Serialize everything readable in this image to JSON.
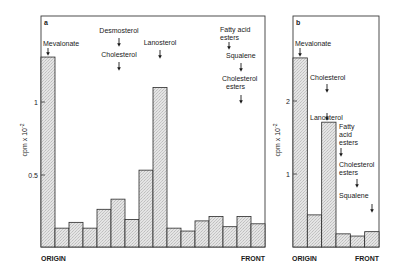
{
  "chart_data": [
    {
      "panel": "a",
      "type": "bar",
      "title": "",
      "xlabel": "",
      "ylabel": "cpm x 10-2",
      "x_start_label": "ORIGIN",
      "x_end_label": "FRONT",
      "ylim": [
        0,
        1.4
      ],
      "yticks": [
        0.5,
        1
      ],
      "ytick_labels": [
        "0.5",
        "1"
      ],
      "grid": false,
      "categories": [
        "1",
        "2",
        "3",
        "4",
        "5",
        "6",
        "7",
        "8",
        "9",
        "10",
        "11",
        "12",
        "13",
        "14",
        "15",
        "16"
      ],
      "values": [
        1.31,
        0.13,
        0.17,
        0.13,
        0.26,
        0.33,
        0.19,
        0.53,
        1.1,
        0.13,
        0.11,
        0.18,
        0.21,
        0.14,
        0.21,
        0.16
      ],
      "annotations": [
        {
          "lines": [
            "Mevalonate"
          ],
          "bar_index": 0
        },
        {
          "lines": [
            "Desmosterol"
          ],
          "bar_index": 5
        },
        {
          "lines": [
            "Cholesterol"
          ],
          "bar_index": 5
        },
        {
          "lines": [
            "Lanosterol"
          ],
          "bar_index": 8
        },
        {
          "lines": [
            "Fatty acid",
            "esters"
          ],
          "bar_index": 13
        },
        {
          "lines": [
            "Squalene"
          ],
          "bar_index": 14
        },
        {
          "lines": [
            "Cholesterol",
            "esters"
          ],
          "bar_index": 14
        }
      ]
    },
    {
      "panel": "b",
      "type": "bar",
      "title": "",
      "xlabel": "",
      "ylabel": "cpm x 10-2",
      "x_start_label": "ORIGIN",
      "x_end_label": "FRONT",
      "ylim": [
        0,
        3.1
      ],
      "yticks": [
        1,
        2
      ],
      "ytick_labels": [
        "1",
        "2"
      ],
      "grid": false,
      "categories": [
        "1",
        "2",
        "3",
        "4",
        "5",
        "6"
      ],
      "values": [
        2.59,
        0.44,
        1.71,
        0.18,
        0.15,
        0.21
      ],
      "annotations": [
        {
          "lines": [
            "Mevalonate"
          ],
          "bar_index": 0
        },
        {
          "lines": [
            "Cholesterol"
          ],
          "bar_index": 1
        },
        {
          "lines": [
            "Lanosterol"
          ],
          "bar_index": 2
        },
        {
          "lines": [
            "Fatty",
            "acid",
            "esters"
          ],
          "bar_index": 3
        },
        {
          "lines": [
            "Cholesterol",
            "esters"
          ],
          "bar_index": 4
        },
        {
          "lines": [
            "Squalene"
          ],
          "bar_index": 5
        }
      ]
    }
  ],
  "panels": {
    "a": {
      "letter": "a",
      "ylabel_main": "cpm x 10",
      "ylabel_exp": "-2",
      "tick_hi": "1",
      "tick_lo": "0.5",
      "origin": "ORIGIN",
      "front": "FRONT",
      "lbl_mevalonate": "Mevalonate",
      "lbl_desmosterol": "Desmosterol",
      "lbl_cholesterol": "Cholesterol",
      "lbl_lanosterol": "Lanosterol",
      "lbl_fatty_1": "Fatty acid",
      "lbl_fatty_2": "esters",
      "lbl_squalene": "Squalene",
      "lbl_cholest_esters_1": "Cholesterol",
      "lbl_cholest_esters_2": "esters"
    },
    "b": {
      "letter": "b",
      "ylabel_main": "cpm x 10",
      "ylabel_exp": "-2",
      "tick_hi": "2",
      "tick_lo": "1",
      "origin": "ORIGIN",
      "front": "FRONT",
      "lbl_mevalonate": "Mevalonate",
      "lbl_cholesterol": "Cholesterol",
      "lbl_lanosterol": "Lanosterol",
      "lbl_fatty_1": "Fatty",
      "lbl_fatty_2": "acid",
      "lbl_fatty_3": "esters",
      "lbl_cholest_esters_1": "Cholesterol",
      "lbl_cholest_esters_2": "esters",
      "lbl_squalene": "Squalene"
    }
  },
  "colors": {
    "bar_fill": "#e2e2e2",
    "bar_stroke": "#2a2a2a",
    "frame": "#3a3a3a"
  }
}
